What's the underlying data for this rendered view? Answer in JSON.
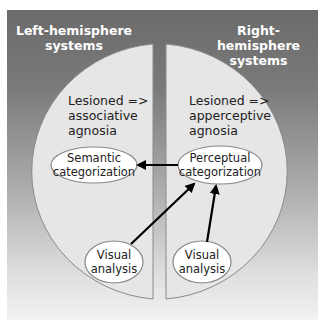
{
  "headers": {
    "left": [
      "Left-hemisphere",
      "systems"
    ],
    "right": [
      "Right-hemisphere",
      "systems"
    ]
  },
  "hemispheres": {
    "left": {
      "annotation": [
        "Lesioned =>",
        "associative",
        "agnosia"
      ]
    },
    "right": {
      "annotation": [
        "Lesioned =>",
        "apperceptive",
        "agnosia"
      ]
    }
  },
  "nodes": {
    "semantic": [
      "Semantic",
      "categorization"
    ],
    "perceptual": [
      "Perceptual",
      "categorization"
    ],
    "visual_left": [
      "Visual",
      "analysis"
    ],
    "visual_right": [
      "Visual",
      "analysis"
    ]
  },
  "edges": [
    {
      "from": "perceptual",
      "to": "semantic"
    },
    {
      "from": "visual_left",
      "to": "perceptual"
    },
    {
      "from": "visual_right",
      "to": "perceptual"
    }
  ],
  "colors": {
    "background_top": "#6b6b6b",
    "background_bottom": "#f2f2f2",
    "hemisphere_fill": "#e6e6e6",
    "node_fill": "#ffffff",
    "arrow": "#000000",
    "header_text": "#ffffff"
  }
}
